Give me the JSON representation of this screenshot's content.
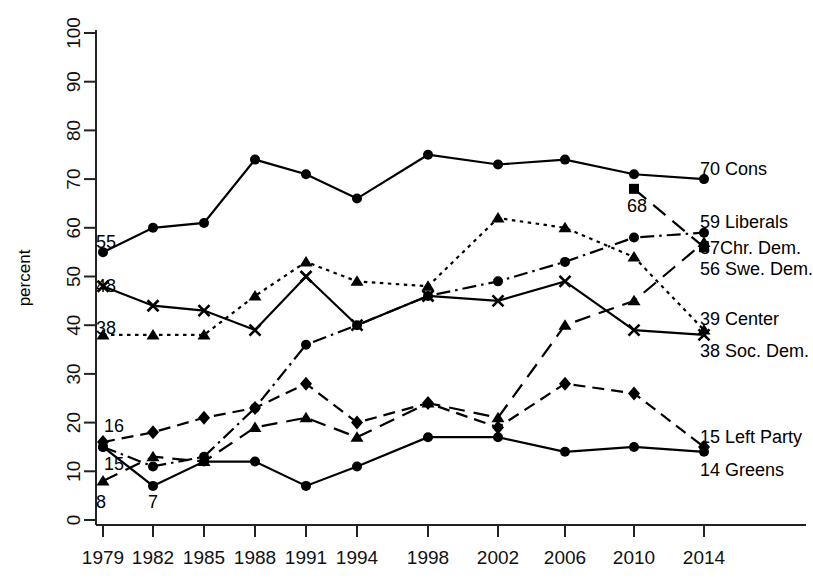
{
  "chart_data": {
    "type": "line",
    "title": "",
    "xlabel": "",
    "ylabel": "percent",
    "ylim": [
      0,
      100
    ],
    "yticks": [
      0,
      10,
      20,
      30,
      40,
      50,
      60,
      70,
      80,
      90,
      100
    ],
    "grid": false,
    "legend_position": "right-inline-end-labels",
    "categories": [
      "1979",
      "1982",
      "1985",
      "1988",
      "1991",
      "1994",
      "1998",
      "2002",
      "2006",
      "2010",
      "2014"
    ],
    "x": [
      1979,
      1982,
      1985,
      1988,
      1991,
      1994,
      1998,
      2002,
      2006,
      2010,
      2014
    ],
    "series": [
      {
        "name": "Cons",
        "end_label": "70 Cons",
        "end_value": 70,
        "start_label": "55",
        "start_value": 55,
        "marker": "circle",
        "dash": "solid",
        "values": [
          55,
          60,
          61,
          74,
          71,
          66,
          75,
          73,
          74,
          71,
          70
        ]
      },
      {
        "name": "Liberals",
        "end_label": "59 Liberals",
        "end_value": 59,
        "start_label": "15",
        "start_value": 15,
        "marker": "circle",
        "dash": "dashdot",
        "values": [
          15,
          11,
          13,
          23,
          36,
          40,
          46,
          49,
          53,
          58,
          59
        ]
      },
      {
        "name": "Chr. Dem.",
        "end_label": "57Chr. Dem.",
        "end_value": 57,
        "start_label": "8",
        "start_value": 8,
        "marker": "triangle",
        "dash": "longdash",
        "values": [
          8,
          13,
          12,
          19,
          21,
          17,
          24,
          21,
          40,
          45,
          57
        ]
      },
      {
        "name": "Swe. Dem.",
        "end_label": "56 Swe. Dem.",
        "end_value": 56,
        "start_label": "68",
        "start_value": 68,
        "marker": "square",
        "dash": "longdash",
        "values": [
          null,
          null,
          null,
          null,
          null,
          null,
          null,
          null,
          null,
          68,
          56
        ]
      },
      {
        "name": "Center",
        "end_label": "39 Center",
        "end_value": 39,
        "start_label": "38",
        "start_value": 38,
        "marker": "triangle",
        "dash": "dotted",
        "values": [
          38,
          38,
          38,
          46,
          53,
          49,
          48,
          62,
          60,
          54,
          39
        ]
      },
      {
        "name": "Soc. Dem.",
        "end_label": "38 Soc. Dem.",
        "end_value": 38,
        "start_label": "48",
        "start_value": 48,
        "marker": "x",
        "dash": "solid",
        "values": [
          48,
          44,
          43,
          39,
          50,
          40,
          46,
          45,
          49,
          39,
          38
        ]
      },
      {
        "name": "Left Party",
        "end_label": "15 Left Party",
        "end_value": 15,
        "start_label": "16",
        "start_value": 16,
        "marker": "diamond",
        "dash": "dashed",
        "values": [
          16,
          18,
          21,
          23,
          28,
          20,
          24,
          19,
          28,
          26,
          15
        ]
      },
      {
        "name": "Greens",
        "end_label": "14 Greens",
        "end_value": 14,
        "start_label": "7",
        "start_value": 7,
        "marker": "circle",
        "dash": "solid",
        "values": [
          15,
          7,
          12,
          12,
          7,
          11,
          17,
          17,
          14,
          15,
          14
        ]
      }
    ],
    "annotations": [
      {
        "text": "55",
        "series": "Cons",
        "at": "1979"
      },
      {
        "text": "48",
        "series": "Soc. Dem.",
        "at": "1979"
      },
      {
        "text": "38",
        "series": "Center",
        "at": "1979"
      },
      {
        "text": "16",
        "series": "Left Party",
        "at": "1979"
      },
      {
        "text": "15",
        "series": "Liberals",
        "at": "1979"
      },
      {
        "text": "8",
        "series": "Chr. Dem.",
        "at": "1979"
      },
      {
        "text": "7",
        "series": "Greens",
        "at": "1982"
      },
      {
        "text": "68",
        "series": "Swe. Dem.",
        "at": "2010"
      }
    ]
  },
  "axis": {
    "ylabel": "percent",
    "yticks": [
      "0",
      "10",
      "20",
      "30",
      "40",
      "50",
      "60",
      "70",
      "80",
      "90",
      "100"
    ],
    "xticks": [
      "1979",
      "1982",
      "1985",
      "1988",
      "1991",
      "1994",
      "1998",
      "2002",
      "2006",
      "2010",
      "2014"
    ]
  },
  "colors": {
    "ink": "#000000",
    "background": "#ffffff"
  }
}
